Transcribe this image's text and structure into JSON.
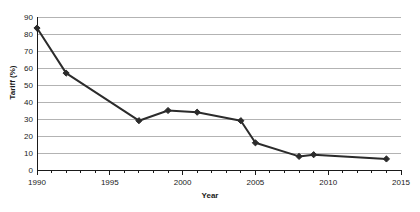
{
  "chart_data": {
    "type": "line",
    "title": "",
    "xlabel": "Year",
    "ylabel": "Tariff (%)",
    "xlim": [
      1990,
      2015
    ],
    "ylim": [
      0,
      90
    ],
    "ytick_step": 10,
    "xtick_step": 5,
    "xminor_step": 1,
    "grid": "horizontal",
    "legend": "none",
    "marker": "diamond",
    "series_color": "#2b2b2b",
    "grid_color": "#b3b3b3",
    "background": "#ffffff",
    "x": [
      1990,
      1992,
      1997,
      1999,
      2001,
      2004,
      2005,
      2008,
      2009,
      2014
    ],
    "values": [
      83.5,
      57,
      29,
      35,
      34,
      29,
      16,
      8,
      9,
      6.5
    ],
    "yticks": [
      0,
      10,
      20,
      30,
      40,
      50,
      60,
      70,
      80,
      90
    ],
    "ytick_labels": [
      "0",
      "10",
      "20",
      "30",
      "40",
      "50",
      "60",
      "70",
      "80",
      "90"
    ],
    "xticks": [
      1990,
      1995,
      2000,
      2005,
      2010,
      2015
    ],
    "xtick_labels": [
      "1990",
      "1995",
      "2000",
      "2005",
      "2010",
      "2015"
    ]
  }
}
